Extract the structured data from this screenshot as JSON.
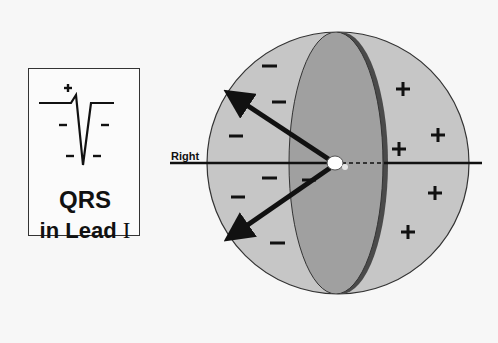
{
  "qrs_panel": {
    "title_line1": "QRS",
    "title_line2_prefix": "in Lead ",
    "title_line2_numeral": "I",
    "wave_signs": {
      "positive": "+",
      "negative": [
        "−",
        "−",
        "−",
        "−"
      ]
    }
  },
  "sphere": {
    "axis_label": "Right",
    "negative_signs_count": 7,
    "positive_signs_count": 6,
    "negative_symbol": "−",
    "positive_symbol": "+",
    "colors": {
      "left_region": "#c4c4c4",
      "right_region": "#c9c9c9",
      "septum": "#9c9c9c",
      "septum_edge": "#4a4a4a",
      "outline": "#333333",
      "arrows": "#111111",
      "background": "#f7f7f7"
    }
  }
}
